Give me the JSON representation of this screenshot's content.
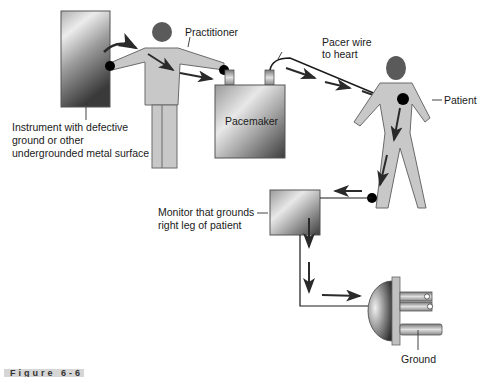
{
  "labels": {
    "instrument": [
      "Instrument with defective",
      "ground or other",
      "undergrounded metal surface"
    ],
    "practitioner": "Practitioner",
    "pacer_wire": [
      "Pacer wire",
      "to heart"
    ],
    "pacemaker": "Pacemaker",
    "patient": "Patient",
    "monitor": [
      "Monitor that grounds",
      "right leg of patient"
    ],
    "ground": "Ground"
  },
  "caption": "Figure 6-6",
  "colors": {
    "body_fill": "#c8c8c8",
    "body_stroke": "#6a6a6a",
    "head_fill": "#5a5a5a",
    "arrow": "#2a2a2a",
    "contact_dot": "#000000"
  }
}
